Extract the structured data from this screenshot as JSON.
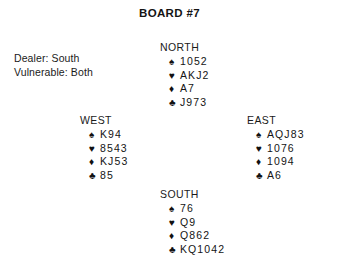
{
  "title": "BOARD #7",
  "conditions": {
    "dealer": "Dealer: South",
    "vulnerable": "Vulnerable: Both"
  },
  "suit_symbols": {
    "spade": "♠",
    "heart": "♥",
    "diamond": "♦",
    "club": "♣"
  },
  "hands": {
    "north": {
      "label": "NORTH",
      "spades": "1052",
      "hearts": "AKJ2",
      "diamonds": "A7",
      "clubs": "J973"
    },
    "west": {
      "label": "WEST",
      "spades": "K94",
      "hearts": "8543",
      "diamonds": "KJ53",
      "clubs": "85"
    },
    "east": {
      "label": "EAST",
      "spades": "AQJ83",
      "hearts": "1076",
      "diamonds": "1094",
      "clubs": "A6"
    },
    "south": {
      "label": "SOUTH",
      "spades": "76",
      "hearts": "Q9",
      "diamonds": "Q862",
      "clubs": "KQ1042"
    }
  }
}
